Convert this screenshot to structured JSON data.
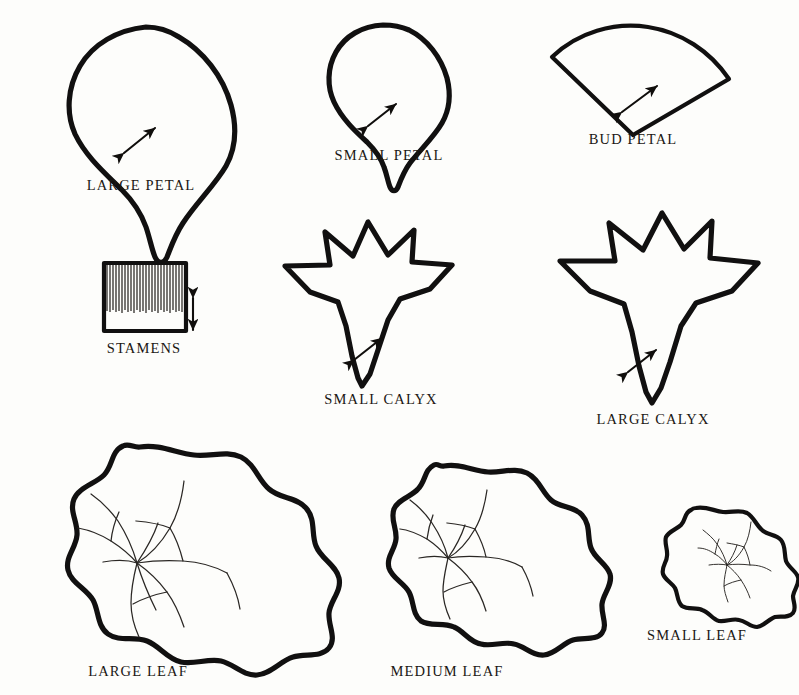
{
  "sheet": {
    "title": "Flower Pattern Pieces Template Sheet",
    "background_color": "#fdfdfb",
    "ink_color": "#111010",
    "width": 799,
    "height": 695
  },
  "pieces": [
    {
      "id": "large-petal",
      "label": "LARGE   PETAL",
      "shape": "petal",
      "label_x": 141,
      "label_y": 185,
      "note": "Large rounded petal with tapered pointed base and double-headed size arrow"
    },
    {
      "id": "small-petal",
      "label": "SMALL  PETAL",
      "shape": "petal",
      "label_x": 389,
      "label_y": 155,
      "note": "Smaller rounded petal with tapered pointed base and double-headed size arrow"
    },
    {
      "id": "bud-petal",
      "label": "BUD PETAL",
      "shape": "sector",
      "label_x": 633,
      "label_y": 139,
      "note": "Fan / circular-sector piece with double-headed size arrow"
    },
    {
      "id": "stamens",
      "label": "STAMENS",
      "shape": "fringed-rectangle",
      "label_x": 144,
      "label_y": 348,
      "note": "Rectangle of fabric fringed along the upper portion, vertical double-headed arrow at right"
    },
    {
      "id": "small-calyx",
      "label": "SMALL  CALYX",
      "shape": "calyx",
      "label_x": 381,
      "label_y": 399,
      "note": "Five pointed crown with tapering pointed stem base and double-headed size arrow"
    },
    {
      "id": "large-calyx",
      "label": "LARGE  CALYX",
      "shape": "calyx",
      "label_x": 653,
      "label_y": 419,
      "note": "Larger five pointed crown with tapering pointed stem base and double-headed size arrow"
    },
    {
      "id": "large-leaf",
      "label": "LARGE  LEAF",
      "shape": "leaf",
      "label_x": 138,
      "label_y": 671,
      "note": "Large scalloped round leaf with radiating branched veins"
    },
    {
      "id": "medium-leaf",
      "label": "MEDIUM  LEAF",
      "shape": "leaf",
      "label_x": 447,
      "label_y": 671,
      "note": "Medium scalloped round leaf with radiating branched veins"
    },
    {
      "id": "small-leaf",
      "label": "SMALL  LEAF",
      "shape": "leaf",
      "label_x": 697,
      "label_y": 635,
      "note": "Small scalloped round leaf with radiating branched veins"
    }
  ]
}
